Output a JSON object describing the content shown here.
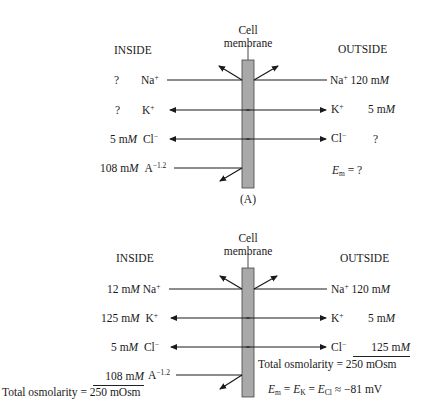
{
  "colors": {
    "membrane_fill": "#a9a9a9",
    "membrane_stroke": "#444444",
    "ink": "#1a1a1a"
  },
  "panel_a": {
    "label": "(A)",
    "membrane_label_1": "Cell",
    "membrane_label_2": "membrane",
    "inside_label": "INSIDE",
    "outside_label": "OUTSIDE",
    "rows": [
      {
        "ion": "Na",
        "charge": "+",
        "inside": "?",
        "outside": "120 m",
        "outside_unit": "M"
      },
      {
        "ion": "K",
        "charge": "+",
        "inside": "?",
        "outside": "5 m",
        "outside_unit": "M"
      },
      {
        "ion": "Cl",
        "charge": "−",
        "inside": "5 m",
        "inside_unit": "M",
        "outside": "?"
      },
      {
        "ion": "A",
        "charge": "−1.2",
        "inside": "108 m",
        "inside_unit": "M"
      }
    ],
    "em_symbol": "E",
    "em_sub": "m",
    "em_value": "= ?"
  },
  "panel_b": {
    "membrane_label_1": "Cell",
    "membrane_label_2": "membrane",
    "inside_label": "INSIDE",
    "outside_label": "OUTSIDE",
    "rows": [
      {
        "ion": "Na",
        "charge": "+",
        "inside": "12 m",
        "inside_unit": "M",
        "outside": "120 m",
        "outside_unit": "M"
      },
      {
        "ion": "K",
        "charge": "+",
        "inside": "125 m",
        "inside_unit": "M",
        "outside": "5 m",
        "outside_unit": "M"
      },
      {
        "ion": "Cl",
        "charge": "−",
        "inside": "5 m",
        "inside_unit": "M",
        "outside": "125 m",
        "outside_unit": "M"
      },
      {
        "ion": "A",
        "charge": "−1.2",
        "inside": "108 m",
        "inside_unit": "M"
      }
    ],
    "inside_total": "Total osmolarity = 250 mOsm",
    "outside_total": "Total osmolarity = 250 mOsm",
    "em_equation": {
      "e": "E",
      "m": "m",
      "k": "K",
      "cl": "Cl",
      "eq": "=",
      "approx": "≈",
      "value": "−81 mV"
    }
  }
}
